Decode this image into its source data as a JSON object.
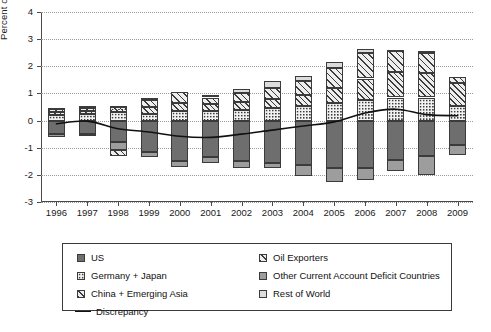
{
  "chart_data": {
    "type": "bar",
    "subtype": "stacked-bar-with-line",
    "title": "",
    "xlabel": "",
    "ylabel": "Percent of Global GDP",
    "ylim": [
      -3,
      4
    ],
    "yticks": [
      4,
      3,
      2,
      1,
      0,
      -1,
      -2,
      -3
    ],
    "ytick_labels": [
      "4",
      "3",
      "2",
      "1",
      "0",
      "-1",
      "-2",
      "-3"
    ],
    "grid": true,
    "legend_position": "below-plot",
    "categories": [
      "1996",
      "1997",
      "1998",
      "1999",
      "2000",
      "2001",
      "2002",
      "2003",
      "2004",
      "2005",
      "2006",
      "2007",
      "2008",
      "2009"
    ],
    "series": [
      {
        "name": "US",
        "pattern": "solid-dark-gray",
        "color": "#6e6e6e",
        "values": [
          -0.5,
          -0.5,
          -0.8,
          -1.15,
          -1.5,
          -1.35,
          -1.5,
          -1.55,
          -1.65,
          -1.75,
          -1.75,
          -1.45,
          -1.3,
          -0.9
        ]
      },
      {
        "name": "Germany + Japan",
        "pattern": "dotted",
        "color": "#f2f2f2",
        "values": [
          0.2,
          0.25,
          0.3,
          0.25,
          0.35,
          0.35,
          0.4,
          0.45,
          0.55,
          0.65,
          0.75,
          0.85,
          0.85,
          0.55
        ]
      },
      {
        "name": "China + Emerging Asia",
        "pattern": "hatch-dot",
        "color": "#ededed",
        "values": [
          0.1,
          0.12,
          0.2,
          0.25,
          0.3,
          0.25,
          0.3,
          0.35,
          0.4,
          0.55,
          0.8,
          0.95,
          0.9,
          0.85
        ]
      },
      {
        "name": "Oil Exporters",
        "pattern": "diagonal-hatch",
        "color": "#eeeeee",
        "values": [
          0.12,
          0.1,
          -0.2,
          0.25,
          0.4,
          0.25,
          0.3,
          0.4,
          0.5,
          0.75,
          0.95,
          0.75,
          0.75,
          0.2
        ]
      },
      {
        "name": "Other Current Account Deficit Countries",
        "pattern": "solid-mid-gray",
        "color": "#9d9d9d",
        "values": [
          -0.1,
          -0.08,
          -0.3,
          -0.18,
          -0.2,
          -0.22,
          -0.25,
          -0.18,
          -0.4,
          -0.5,
          -0.45,
          -0.4,
          -0.7,
          -0.35
        ]
      },
      {
        "name": "Rest of World",
        "pattern": "solid-light-gray",
        "color": "#dcdcdc",
        "values": [
          0.03,
          0.07,
          0.02,
          0.1,
          0.0,
          0.08,
          0.15,
          0.25,
          0.2,
          0.2,
          0.15,
          0.05,
          0.05,
          0.0
        ]
      }
    ],
    "line_series": {
      "name": "Discrepancy",
      "color": "#111111",
      "values": [
        -0.12,
        -0.02,
        -0.3,
        -0.42,
        -0.58,
        -0.62,
        -0.5,
        -0.35,
        -0.2,
        -0.05,
        0.28,
        0.42,
        0.22,
        0.18
      ]
    }
  },
  "legend": {
    "items": [
      {
        "label": "US",
        "swatch": "p-us"
      },
      {
        "label": "Oil Exporters",
        "swatch": "p-oil"
      },
      {
        "label": "Germany + Japan",
        "swatch": "p-gj"
      },
      {
        "label": "Other Current Account Deficit Countries",
        "swatch": "p-ocad"
      },
      {
        "label": "China + Emerging Asia",
        "swatch": "p-cea"
      },
      {
        "label": "Rest of World",
        "swatch": "p-row"
      },
      {
        "label": "Discrepancy",
        "swatch": "line"
      }
    ]
  }
}
